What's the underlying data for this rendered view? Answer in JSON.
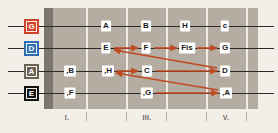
{
  "diagram": {
    "notation": "German",
    "board": {
      "background_color": "#b5ada1",
      "nut_color": "#7d766d",
      "fret_line_color": "#efece6",
      "page_background": "#f2efe9"
    },
    "arrow_color": "#c04a22"
  },
  "strings": [
    {
      "name": "G",
      "label": "G",
      "color": "#d2442a",
      "index": 0
    },
    {
      "name": "D",
      "label": "D",
      "color": "#2d6fb0",
      "index": 1
    },
    {
      "name": "A",
      "label": "A",
      "color": "#6b6354",
      "index": 2
    },
    {
      "name": "E",
      "label": "E",
      "color": "#131313",
      "index": 3
    }
  ],
  "notes": {
    "g_string": [
      {
        "text": "A",
        "fret": 2,
        "x": 106,
        "y": 26
      },
      {
        "text": "B",
        "fret": 3,
        "x": 146,
        "y": 26
      },
      {
        "text": "H",
        "fret": 4,
        "x": 185,
        "y": 26
      },
      {
        "text": "c",
        "fret": 5,
        "x": 225,
        "y": 26
      }
    ],
    "d_string": [
      {
        "text": "E",
        "fret": 2,
        "x": 106,
        "y": 48
      },
      {
        "text": "F",
        "fret": 3,
        "x": 146,
        "y": 48
      },
      {
        "text": "Fis",
        "fret": 4,
        "x": 187,
        "y": 48
      },
      {
        "text": "G",
        "fret": 5,
        "x": 225,
        "y": 48
      }
    ],
    "a_string": [
      {
        "text": ",B",
        "fret": 1,
        "x": 70,
        "y": 71
      },
      {
        "text": ",H",
        "fret": 2,
        "x": 108,
        "y": 71
      },
      {
        "text": "C",
        "fret": 3,
        "x": 147,
        "y": 71
      },
      {
        "text": "D",
        "fret": 5,
        "x": 225,
        "y": 71
      }
    ],
    "e_string": [
      {
        "text": ",F",
        "fret": 1,
        "x": 70,
        "y": 93
      },
      {
        "text": ",G",
        "fret": 3,
        "x": 147,
        "y": 93
      },
      {
        "text": ",A",
        "fret": 5,
        "x": 226,
        "y": 93
      }
    ]
  },
  "frets": {
    "line_x": [
      86,
      126,
      166,
      206,
      246
    ],
    "markers": [
      {
        "label": "I.",
        "x": 67
      },
      {
        "label": "III.",
        "x": 147
      },
      {
        "label": "V.",
        "x": 226
      }
    ],
    "ticks_x": [
      86,
      126,
      166,
      206,
      246
    ]
  },
  "arrows": [
    {
      "name": "e-to-f",
      "x1": 114,
      "y1": 48,
      "x2": 138,
      "y2": 48
    },
    {
      "name": "f-to-fis",
      "x1": 154,
      "y1": 48,
      "x2": 177,
      "y2": 48
    },
    {
      "name": "fis-to-g",
      "x1": 197,
      "y1": 48,
      "x2": 217,
      "y2": 48
    },
    {
      "name": "h-to-c",
      "x1": 116,
      "y1": 71,
      "x2": 138,
      "y2": 71
    },
    {
      "name": "c-to-d",
      "x1": 156,
      "y1": 71,
      "x2": 217,
      "y2": 71
    },
    {
      "name": "g-to-a",
      "x1": 156,
      "y1": 93,
      "x2": 218,
      "y2": 93
    },
    {
      "name": "d-back-to-e",
      "x1": 217,
      "y1": 68,
      "x2": 114,
      "y2": 50
    },
    {
      "name": "a-back-to-c",
      "x1": 218,
      "y1": 90,
      "x2": 116,
      "y2": 73
    }
  ]
}
